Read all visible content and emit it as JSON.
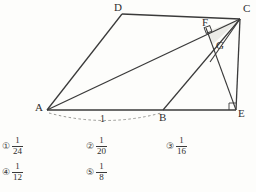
{
  "figure": {
    "type": "geometry-diagram",
    "background_color": "#fdfdfb",
    "line_color": "#3a3a3a",
    "shaded_color": "#e8e8e4",
    "vertices": [
      {
        "id": "A",
        "label": "A",
        "x": 47,
        "y": 110,
        "label_x": 36,
        "label_y": 103
      },
      {
        "id": "B",
        "label": "B",
        "x": 163,
        "y": 110,
        "label_x": 160,
        "label_y": 113
      },
      {
        "id": "C",
        "label": "C",
        "x": 240,
        "y": 19,
        "label_x": 243,
        "label_y": 4
      },
      {
        "id": "D",
        "label": "D",
        "x": 122,
        "y": 14,
        "label_x": 114,
        "label_y": 2
      },
      {
        "id": "E",
        "label": "E",
        "x": 236,
        "y": 110,
        "label_x": 238,
        "label_y": 110
      },
      {
        "id": "F",
        "label": "F",
        "x": 208,
        "y": 31,
        "label_x": 203,
        "label_y": 18
      },
      {
        "id": "G",
        "label": "G",
        "x": 213,
        "y": 44,
        "label_x": 216,
        "label_y": 41
      }
    ],
    "segments": [
      {
        "from": "A",
        "to": "D"
      },
      {
        "from": "D",
        "to": "C"
      },
      {
        "from": "A",
        "to": "E"
      },
      {
        "from": "C",
        "to": "E"
      },
      {
        "from": "A",
        "to": "C"
      },
      {
        "from": "B",
        "to": "C"
      },
      {
        "from": "C",
        "to": "G"
      },
      {
        "from": "A",
        "to": "G"
      }
    ],
    "right_angles": [
      {
        "at": "F",
        "description": "perpendicular-from-C-to-AF"
      },
      {
        "at": "E",
        "description": "angle-AEC"
      }
    ],
    "measurements": [
      {
        "label": "1",
        "from": "A",
        "to": "B",
        "style": "dashed-arc",
        "label_x": 100,
        "label_y": 117
      }
    ]
  },
  "choices": [
    {
      "marker": "①",
      "numerator": "1",
      "denominator": "24"
    },
    {
      "marker": "②",
      "numerator": "1",
      "denominator": "20"
    },
    {
      "marker": "③",
      "numerator": "1",
      "denominator": "16"
    },
    {
      "marker": "④",
      "numerator": "1",
      "denominator": "12"
    },
    {
      "marker": "⑤",
      "numerator": "1",
      "denominator": "8"
    }
  ]
}
